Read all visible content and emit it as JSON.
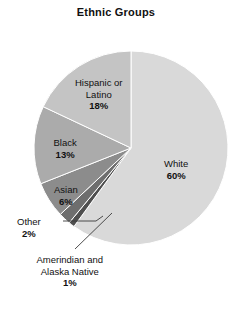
{
  "chart_data": {
    "type": "pie",
    "title": "Ethnic Groups",
    "xlabel": "",
    "ylabel": "",
    "legend": "none",
    "grid": false,
    "unit": "%",
    "start_angle_deg": 0,
    "direction": "clockwise",
    "categories": [
      "White",
      "Amerindian and Alaska Native",
      "Other",
      "Asian",
      "Black",
      "Hispanic or Latino"
    ],
    "values": [
      60,
      1,
      2,
      6,
      13,
      18
    ],
    "slices": [
      {
        "id": "white",
        "name": "White",
        "name_lines": [
          "White"
        ],
        "value": 60,
        "value_label": "60%",
        "color": "#d9d9d9",
        "label_placement": "inside",
        "label_x": 176,
        "label_y": 158
      },
      {
        "id": "amerindian",
        "name": "Amerindian and Alaska Native",
        "name_lines": [
          "Amerindian and",
          "Alaska Native"
        ],
        "value": 1,
        "value_label": "1%",
        "color": "#4f4f4f",
        "label_placement": "outside",
        "label_x": 70,
        "label_y": 254
      },
      {
        "id": "other",
        "name": "Other",
        "name_lines": [
          "Other"
        ],
        "value": 2,
        "value_label": "2%",
        "color": "#6e6e6e",
        "label_placement": "outside",
        "label_x": 29,
        "label_y": 216
      },
      {
        "id": "asian",
        "name": "Asian",
        "name_lines": [
          "Asian"
        ],
        "value": 6,
        "value_label": "6%",
        "color": "#8c8c8c",
        "label_placement": "inside",
        "label_x": 66,
        "label_y": 184
      },
      {
        "id": "black",
        "name": "Black",
        "name_lines": [
          "Black"
        ],
        "value": 13,
        "value_label": "13%",
        "color": "#ababab",
        "label_placement": "inside",
        "label_x": 65,
        "label_y": 137
      },
      {
        "id": "hispanic",
        "name": "Hispanic or Latino",
        "name_lines": [
          "Hispanic or",
          "Latino"
        ],
        "value": 18,
        "value_label": "18%",
        "color": "#c4c4c4",
        "label_placement": "inside",
        "label_x": 99,
        "label_y": 77
      }
    ],
    "geometry": {
      "cx": 131,
      "cy": 148,
      "r": 97
    },
    "leader_lines": [
      {
        "id": "other-leader",
        "x1": 63,
        "y1": 221,
        "x2": 96,
        "y2": 221,
        "x3": 103,
        "y3": 216
      },
      {
        "id": "amerindian-leader",
        "x1": 75,
        "y1": 249,
        "x2": 112,
        "y2": 213
      }
    ],
    "colors": {
      "stroke": "#ffffff",
      "leader": "#3a3a3a",
      "text": "#111111",
      "background": "#ffffff"
    }
  }
}
